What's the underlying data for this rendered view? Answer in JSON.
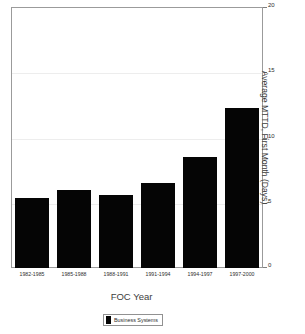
{
  "chart_data": {
    "type": "bar",
    "title": "",
    "xlabel": "FOC Year",
    "ylabel": "Average MTTD, First Month (Days)",
    "categories": [
      "1982-1985",
      "1985-1988",
      "1988-1991",
      "1991-1994",
      "1994-1997",
      "1997-2000"
    ],
    "values": [
      5.4,
      6.0,
      5.6,
      6.5,
      8.5,
      12.3
    ],
    "series": [
      {
        "name": "Business Systems",
        "color": "#000000",
        "values": [
          5.4,
          6.0,
          5.6,
          6.5,
          8.5,
          12.3
        ]
      }
    ],
    "ylim": [
      0,
      20
    ],
    "yticks": [
      0,
      5,
      10,
      15,
      20
    ],
    "ytick_labels": [
      "0",
      "5",
      "10",
      "15",
      "20"
    ],
    "y_axis_position": "right",
    "grid": true,
    "legend": {
      "position": "bottom",
      "entries": [
        {
          "label": "Business Systems",
          "color": "#000000"
        }
      ]
    }
  },
  "colors": {
    "bar": "#000000",
    "frame": "#9a9a9a",
    "grid": "#ededed",
    "text": "#2b2b2b",
    "background": "#ffffff"
  }
}
